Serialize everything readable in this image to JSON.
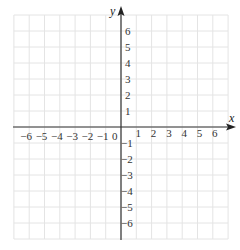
{
  "diagram": {
    "type": "cartesian-coordinate-grid",
    "x_axis": {
      "name": "x",
      "min": -6,
      "max": 6,
      "tick_labels": [
        "-6",
        "-5",
        "-4",
        "-3",
        "-2",
        "-1",
        "1",
        "2",
        "3",
        "4",
        "5",
        "6"
      ]
    },
    "y_axis": {
      "name": "y",
      "min": -6,
      "max": 6,
      "tick_labels_positive": [
        "1",
        "2",
        "3",
        "4",
        "5",
        "6"
      ],
      "tick_labels_negative": [
        "-1",
        "-2",
        "-3",
        "-4",
        "-5",
        "-6"
      ]
    },
    "origin_label": "0",
    "grid": {
      "visible": true,
      "cells_each_side": 7
    },
    "colors": {
      "grid": "#e4e4e4",
      "axis": "#333333",
      "text": "#333333"
    }
  }
}
